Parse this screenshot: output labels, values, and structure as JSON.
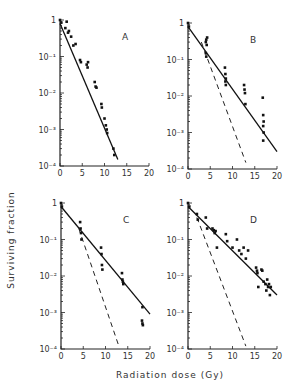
{
  "figure": {
    "xlabel": "Radiation dose (Gy)",
    "ylabel": "Surviving fraction"
  },
  "chart_data": [
    {
      "type": "scatter",
      "panel": "A",
      "xlabel": "Radiation dose (Gy)",
      "ylabel": "Surviving fraction",
      "xlim": [
        0,
        20
      ],
      "ylim": [
        0.0001,
        1
      ],
      "yscale": "log",
      "xticks": [
        0,
        5,
        10,
        15,
        20
      ],
      "yticks": [
        "10^-4",
        "10^-3",
        "10^-2",
        "10^-1",
        "1"
      ],
      "points": [
        [
          0,
          1
        ],
        [
          0.3,
          0.85
        ],
        [
          1.2,
          0.6
        ],
        [
          1.5,
          0.9
        ],
        [
          1.8,
          0.45
        ],
        [
          2,
          0.5
        ],
        [
          2.5,
          0.35
        ],
        [
          3,
          0.2
        ],
        [
          3.5,
          0.22
        ],
        [
          4.5,
          0.08
        ],
        [
          4.7,
          0.07
        ],
        [
          6,
          0.06
        ],
        [
          6.2,
          0.05
        ],
        [
          6.3,
          0.07
        ],
        [
          7.8,
          0.02
        ],
        [
          8,
          0.015
        ],
        [
          8.2,
          0.014
        ],
        [
          9.3,
          0.005
        ],
        [
          9.4,
          0.004
        ],
        [
          10,
          0.002
        ],
        [
          10.3,
          0.0013
        ],
        [
          10.5,
          0.001
        ],
        [
          10.6,
          0.0008
        ],
        [
          12,
          0.0003
        ],
        [
          12.2,
          0.0002
        ]
      ],
      "fit_line": [
        [
          0,
          0.8
        ],
        [
          13,
          0.00015
        ]
      ],
      "dashed_line": null
    },
    {
      "type": "scatter",
      "panel": "B",
      "xlim": [
        0,
        20
      ],
      "ylim": [
        0.0001,
        1
      ],
      "yscale": "log",
      "xticks": [
        0,
        5,
        10,
        15,
        20
      ],
      "points": [
        [
          0,
          1
        ],
        [
          0.2,
          0.8
        ],
        [
          4,
          0.3
        ],
        [
          4.1,
          0.35
        ],
        [
          4.2,
          0.25
        ],
        [
          4.3,
          0.4
        ],
        [
          4,
          0.15
        ],
        [
          4.1,
          0.12
        ],
        [
          8.3,
          0.06
        ],
        [
          8.4,
          0.04
        ],
        [
          8.5,
          0.03
        ],
        [
          8.4,
          0.025
        ],
        [
          8.5,
          0.02
        ],
        [
          12.6,
          0.02
        ],
        [
          12.7,
          0.015
        ],
        [
          12.8,
          0.012
        ],
        [
          12.9,
          0.006
        ],
        [
          16.8,
          0.009
        ],
        [
          16.9,
          0.003
        ],
        [
          17,
          0.002
        ],
        [
          16.9,
          0.0015
        ],
        [
          17,
          0.001
        ],
        [
          16.9,
          0.0006
        ]
      ],
      "fit_line": [
        [
          0,
          0.8
        ],
        [
          20,
          0.0003
        ]
      ],
      "dashed_line": [
        [
          3,
          0.3
        ],
        [
          13,
          0.00015
        ]
      ]
    },
    {
      "type": "scatter",
      "panel": "C",
      "xlim": [
        0,
        20
      ],
      "ylim": [
        0.0001,
        1
      ],
      "yscale": "log",
      "xticks": [
        0,
        5,
        10,
        15,
        20
      ],
      "points": [
        [
          0,
          1
        ],
        [
          0.2,
          0.8
        ],
        [
          4.3,
          0.3
        ],
        [
          4.4,
          0.2
        ],
        [
          4.5,
          0.15
        ],
        [
          4.6,
          0.1
        ],
        [
          9,
          0.06
        ],
        [
          9.1,
          0.04
        ],
        [
          9.2,
          0.02
        ],
        [
          9.3,
          0.015
        ],
        [
          13.7,
          0.012
        ],
        [
          13.8,
          0.008
        ],
        [
          13.9,
          0.007
        ],
        [
          14,
          0.006
        ],
        [
          18.3,
          0.0014
        ],
        [
          18.2,
          0.0006
        ],
        [
          18.3,
          0.0005
        ],
        [
          18.4,
          0.00045
        ]
      ],
      "fit_line": [
        [
          0,
          0.8
        ],
        [
          20,
          0.0009
        ]
      ],
      "dashed_line": [
        [
          4,
          0.2
        ],
        [
          13,
          0.00012
        ]
      ]
    },
    {
      "type": "scatter",
      "panel": "D",
      "xlim": [
        0,
        20
      ],
      "ylim": [
        0.0001,
        1
      ],
      "yscale": "log",
      "xticks": [
        0,
        5,
        10,
        15,
        20
      ],
      "points": [
        [
          0,
          1
        ],
        [
          0.3,
          0.8
        ],
        [
          2,
          0.5
        ],
        [
          2.2,
          0.35
        ],
        [
          4,
          0.4
        ],
        [
          4.3,
          0.2
        ],
        [
          5.5,
          0.2
        ],
        [
          5.8,
          0.18
        ],
        [
          6,
          0.15
        ],
        [
          6.2,
          0.17
        ],
        [
          6.5,
          0.06
        ],
        [
          8.5,
          0.14
        ],
        [
          8.8,
          0.09
        ],
        [
          10,
          0.06
        ],
        [
          11,
          0.1
        ],
        [
          11.5,
          0.05
        ],
        [
          12,
          0.04
        ],
        [
          12.5,
          0.06
        ],
        [
          13,
          0.03
        ],
        [
          13.5,
          0.05
        ],
        [
          15.3,
          0.017
        ],
        [
          15.5,
          0.014
        ],
        [
          15.6,
          0.012
        ],
        [
          15.8,
          0.005
        ],
        [
          16.5,
          0.015
        ],
        [
          16.7,
          0.014
        ],
        [
          17,
          0.007
        ],
        [
          17.4,
          0.006
        ],
        [
          17.6,
          0.004
        ],
        [
          17.8,
          0.008
        ],
        [
          18,
          0.005
        ],
        [
          18.2,
          0.006
        ],
        [
          18.4,
          0.003
        ],
        [
          18.6,
          0.005
        ]
      ],
      "fit_line": [
        [
          0,
          0.8
        ],
        [
          20,
          0.003
        ]
      ],
      "dashed_line": [
        [
          2,
          0.4
        ],
        [
          13,
          0.00012
        ]
      ]
    }
  ],
  "panels": [
    {
      "label": "A",
      "ox": 60,
      "oy": 166,
      "has_dash": false
    },
    {
      "label": "B",
      "ox": 188,
      "oy": 169,
      "has_dash": true
    },
    {
      "label": "C",
      "ox": 61,
      "oy": 349,
      "has_dash": true
    },
    {
      "label": "D",
      "ox": 188,
      "oy": 349,
      "has_dash": true
    }
  ],
  "axis": {
    "xtick_labels": [
      "0",
      "5",
      "10",
      "15",
      "20"
    ],
    "ytick_labels": [
      "10⁻⁴",
      "10⁻³",
      "10⁻²",
      "10⁻¹",
      "1"
    ]
  }
}
